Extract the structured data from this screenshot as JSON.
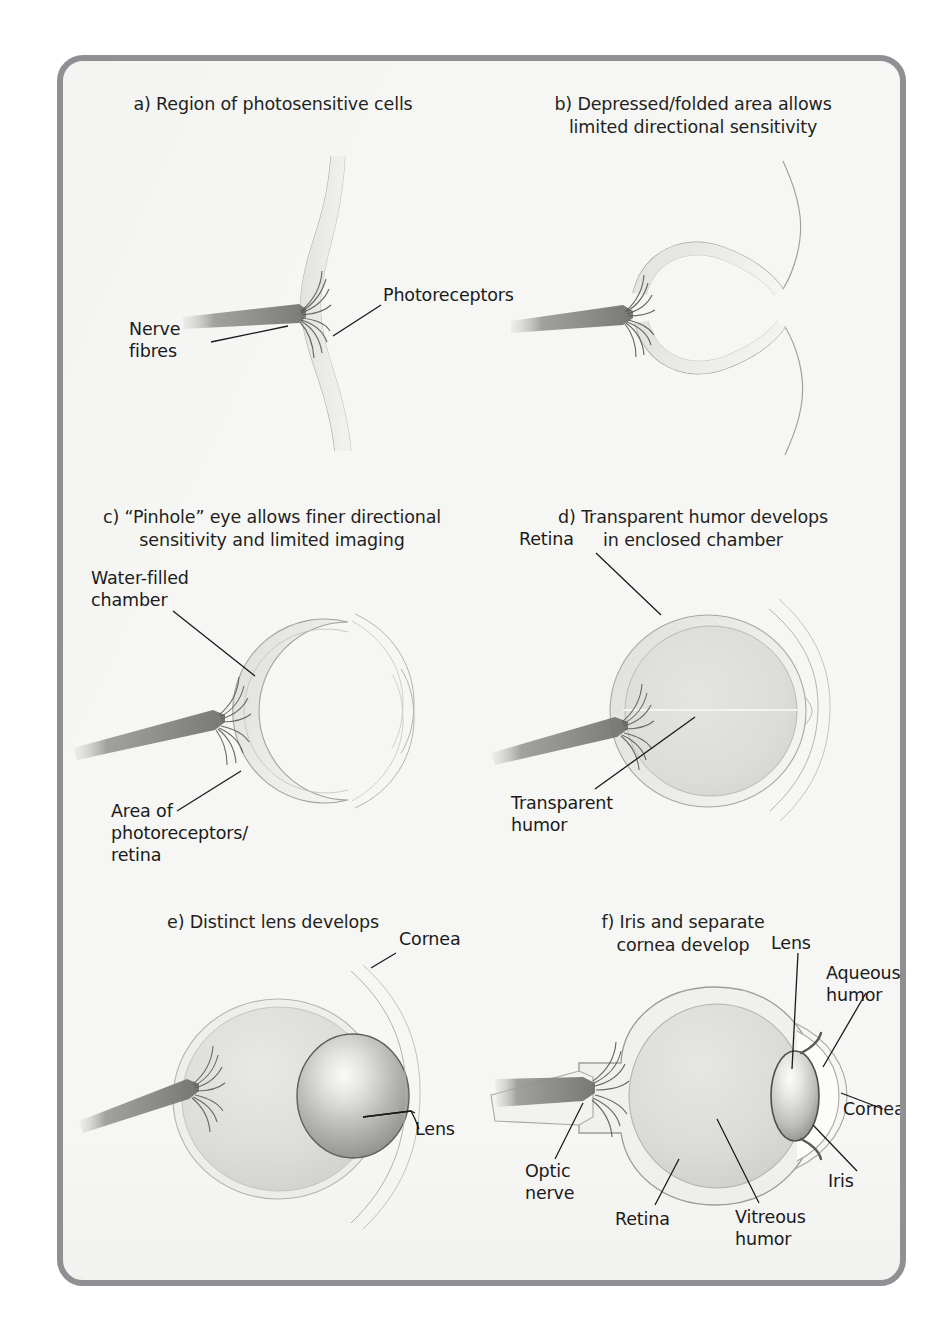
{
  "figure": {
    "background_color": "#f6f6f4",
    "frame_color": "#8f9094",
    "ink_color": "#1a1a1a"
  },
  "panels": [
    {
      "id": "a",
      "caption": "a) Region of photosensitive cells",
      "caption_lines": [
        "a) Region of photosensitive cells"
      ],
      "labels": [
        {
          "name": "photoreceptors",
          "text": "Photoreceptors"
        },
        {
          "name": "nerve-fibres",
          "text_lines": [
            "Nerve",
            "fibres"
          ],
          "line1": "Nerve",
          "line2": "fibres"
        }
      ]
    },
    {
      "id": "b",
      "caption": "b) Depressed/folded area allows limited directional sensitivity",
      "caption_lines": [
        "b) Depressed/folded area allows",
        "limited directional sensitivity"
      ],
      "line1": "b) Depressed/folded area allows",
      "line2": "limited directional sensitivity",
      "labels": []
    },
    {
      "id": "c",
      "caption": "c) “Pinhole” eye allows finer directional sensitivity and limited imaging",
      "caption_lines": [
        "c) “Pinhole” eye allows finer directional",
        "sensitivity and limited imaging"
      ],
      "line1": "c) “Pinhole” eye allows finer directional",
      "line2": "sensitivity and limited imaging",
      "labels": [
        {
          "name": "water-filled-chamber",
          "line1": "Water-filled",
          "line2": "chamber"
        },
        {
          "name": "area-of-photoreceptors-retina",
          "line1": "Area of",
          "line2": "photoreceptors/",
          "line3": "retina"
        }
      ]
    },
    {
      "id": "d",
      "caption": "d) Transparent humor develops in enclosed chamber",
      "caption_lines": [
        "d) Transparent humor develops",
        "in enclosed chamber"
      ],
      "line1": "d) Transparent humor develops",
      "line2": "in enclosed chamber",
      "labels": [
        {
          "name": "retina",
          "text": "Retina"
        },
        {
          "name": "transparent-humor",
          "line1": "Transparent",
          "line2": "humor"
        }
      ]
    },
    {
      "id": "e",
      "caption": "e) Distinct lens develops",
      "caption_lines": [
        "e) Distinct lens develops"
      ],
      "line1": "e) Distinct lens develops",
      "labels": [
        {
          "name": "cornea",
          "text": "Cornea"
        },
        {
          "name": "lens",
          "text": "Lens"
        }
      ]
    },
    {
      "id": "f",
      "caption": "f) Iris and separate cornea develop",
      "caption_lines": [
        "f) Iris and separate",
        "cornea develop"
      ],
      "line1": "f) Iris and separate",
      "line2": "cornea develop",
      "labels": [
        {
          "name": "lens",
          "text": "Lens"
        },
        {
          "name": "aqueous-humor",
          "line1": "Aqueous",
          "line2": "humor"
        },
        {
          "name": "cornea",
          "text": "Cornea"
        },
        {
          "name": "iris",
          "text": "Iris"
        },
        {
          "name": "optic-nerve",
          "line1": "Optic",
          "line2": "nerve"
        },
        {
          "name": "retina",
          "text": "Retina"
        },
        {
          "name": "vitreous-humor",
          "line1": "Vitreous",
          "line2": "humor"
        }
      ]
    }
  ]
}
